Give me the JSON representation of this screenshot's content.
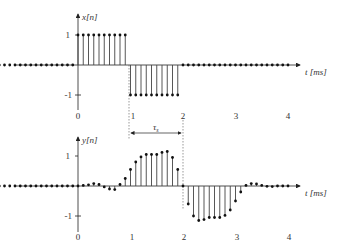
{
  "chart_data": [
    {
      "type": "stem",
      "title": "",
      "ylabel": "x[n]",
      "xlabel": "t [ms]",
      "xticks": [
        "0",
        "1",
        "2",
        "3",
        "4"
      ],
      "yticks": [
        "1",
        "-1"
      ],
      "t_step_ms": 0.1,
      "x": [
        -1.5,
        -1.4,
        -1.3,
        -1.2,
        -1.1,
        -1.0,
        -0.9,
        -0.8,
        -0.7,
        -0.6,
        -0.5,
        -0.4,
        -0.3,
        -0.2,
        -0.1,
        0.0,
        0.1,
        0.2,
        0.3,
        0.4,
        0.5,
        0.6,
        0.7,
        0.8,
        0.9,
        1.0,
        1.1,
        1.2,
        1.3,
        1.4,
        1.5,
        1.6,
        1.7,
        1.8,
        1.9,
        2.0,
        2.1,
        2.2,
        2.3,
        2.4,
        2.5,
        2.6,
        2.7,
        2.8,
        2.9,
        3.0,
        3.1,
        3.2,
        3.3,
        3.4,
        3.5,
        3.6,
        3.7,
        3.8,
        3.9,
        4.0
      ],
      "values": [
        0,
        0,
        0,
        0,
        0,
        0,
        0,
        0,
        0,
        0,
        0,
        0,
        0,
        0,
        0,
        1,
        1,
        1,
        1,
        1,
        1,
        1,
        1,
        1,
        1,
        -1,
        -1,
        -1,
        -1,
        -1,
        -1,
        -1,
        -1,
        -1,
        -1,
        0,
        0,
        0,
        0,
        0,
        0,
        0,
        0,
        0,
        0,
        0,
        0,
        0,
        0,
        0,
        0,
        0,
        0,
        0,
        0,
        0
      ],
      "annotation": {
        "label": "τs",
        "from": 1,
        "to": 2
      }
    },
    {
      "type": "stem",
      "title": "",
      "ylabel": "y[n]",
      "xlabel": "t [ms]",
      "xticks": [
        "0",
        "1",
        "2",
        "3",
        "4"
      ],
      "yticks": [
        "1",
        "-1"
      ],
      "t_step_ms": 0.1,
      "x": [
        -1.5,
        -1.4,
        -1.3,
        -1.2,
        -1.1,
        -1.0,
        -0.9,
        -0.8,
        -0.7,
        -0.6,
        -0.5,
        -0.4,
        -0.3,
        -0.2,
        -0.1,
        0.0,
        0.1,
        0.2,
        0.3,
        0.4,
        0.5,
        0.6,
        0.7,
        0.8,
        0.9,
        1.0,
        1.1,
        1.2,
        1.3,
        1.4,
        1.5,
        1.6,
        1.7,
        1.8,
        1.9,
        2.0,
        2.1,
        2.2,
        2.3,
        2.4,
        2.5,
        2.6,
        2.7,
        2.8,
        2.9,
        3.0,
        3.1,
        3.2,
        3.3,
        3.4,
        3.5,
        3.6,
        3.7,
        3.8,
        3.9,
        4.0
      ],
      "values": [
        0,
        0,
        0,
        0,
        0,
        0,
        0,
        0,
        0,
        0,
        0,
        0,
        0,
        0,
        0,
        0,
        0.02,
        0.04,
        0.08,
        0.05,
        -0.03,
        -0.1,
        -0.12,
        0.05,
        0.25,
        0.55,
        0.8,
        0.97,
        1.05,
        1.05,
        1.05,
        1.12,
        1.15,
        0.95,
        0.55,
        0,
        -0.6,
        -1.0,
        -1.15,
        -1.12,
        -1.05,
        -1.05,
        -1.05,
        -0.98,
        -0.8,
        -0.5,
        -0.2,
        0.02,
        0.08,
        0.07,
        0.02,
        -0.01,
        -0.02,
        0,
        0,
        0
      ]
    }
  ],
  "top_plot": {
    "ylabel": "x[n]",
    "xlabel": "t [ms]",
    "ytick_pos": "1",
    "ytick_neg": "-1",
    "xticks": [
      "0",
      "1",
      "2",
      "3",
      "4"
    ],
    "tau_label": "τ",
    "tau_sub": "s"
  },
  "bottom_plot": {
    "ylabel": "y[n]",
    "xlabel": "t [ms]",
    "ytick_pos": "1",
    "ytick_neg": "-1",
    "xticks": [
      "0",
      "1",
      "2",
      "3",
      "4"
    ]
  },
  "colors": {
    "stem": "#444444",
    "axis": "#222222",
    "text": "#333333"
  }
}
